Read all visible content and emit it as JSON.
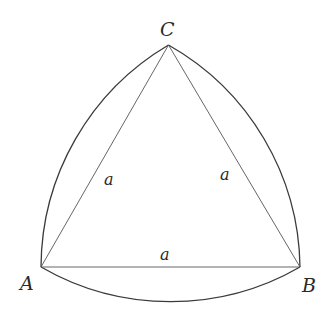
{
  "diagram": {
    "vertices": [
      {
        "name": "A",
        "x": 41,
        "y": 267
      },
      {
        "name": "B",
        "x": 300,
        "y": 267
      },
      {
        "name": "C",
        "x": 168.5,
        "y": 45
      }
    ],
    "side_labels": {
      "AC": "a",
      "BC": "a",
      "AB": "a"
    },
    "vertex_labels": {
      "A": "A",
      "B": "B",
      "C": "C"
    },
    "colors": {
      "stroke": "#3a3a3a",
      "background": "#ffffff",
      "text": "#2a2a2a"
    }
  }
}
